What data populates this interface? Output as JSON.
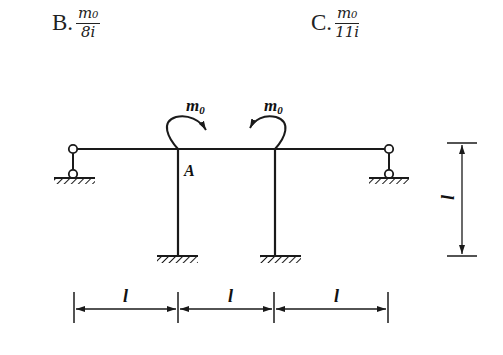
{
  "options": [
    {
      "letter": "B.",
      "numerator": "m₀",
      "denominator": "8i"
    },
    {
      "letter": "C.",
      "numerator": "m₀",
      "denominator": "11i"
    }
  ],
  "figure": {
    "moment_left_label": "m",
    "moment_left_sub": "0",
    "moment_right_label": "m",
    "moment_right_sub": "0",
    "joint_label": "A",
    "vertical_dimension_label": "l",
    "horizontal_dimension_labels": [
      "l",
      "l",
      "l"
    ],
    "line_color": "#1a1a1a"
  }
}
